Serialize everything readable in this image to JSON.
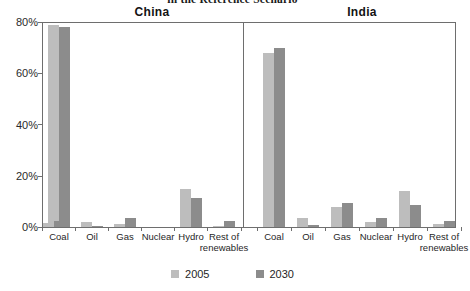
{
  "chart_data": {
    "type": "bar",
    "title": "in the Reference Scenario",
    "xlabel": "",
    "ylabel": "",
    "ylim": [
      0,
      80
    ],
    "yticks": [
      "0%",
      "20%",
      "40%",
      "60%",
      "80%"
    ],
    "ytick_values": [
      0,
      20,
      40,
      60,
      80
    ],
    "grid": false,
    "legend_position": "bottom",
    "categories": [
      "Coal",
      "Oil",
      "Gas",
      "Nuclear",
      "Hydro",
      "Rest of renewables"
    ],
    "panels": [
      {
        "name": "China",
        "series": [
          {
            "name": "2005",
            "values": [
              79,
              2,
              1,
              1.5,
              15,
              0.3
            ]
          },
          {
            "name": "2030",
            "values": [
              78,
              0.4,
              3.5,
              2.5,
              11.5,
              2.5
            ]
          }
        ]
      },
      {
        "name": "India",
        "series": [
          {
            "name": "2005",
            "values": [
              68,
              3.5,
              8,
              2,
              14,
              1
            ]
          },
          {
            "name": "2030",
            "values": [
              70,
              0.8,
              9.5,
              3.5,
              8.5,
              2.5
            ]
          }
        ]
      }
    ],
    "series_colors": {
      "2005": "#bdbdbd",
      "2030": "#8c8c8c"
    }
  },
  "legend": {
    "items": [
      {
        "label": "2005",
        "color": "#bdbdbd"
      },
      {
        "label": "2030",
        "color": "#8c8c8c"
      }
    ]
  }
}
